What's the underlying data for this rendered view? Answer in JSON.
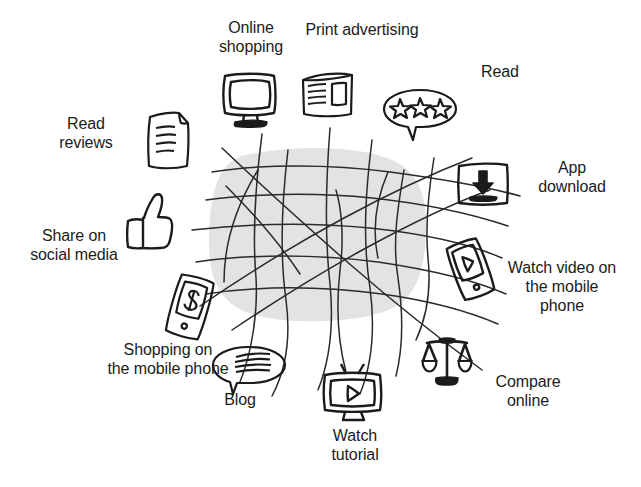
{
  "diagram": {
    "background_color": "#ffffff",
    "ink_color": "#1b1b1b",
    "blob_color": "#e3e3e3",
    "center": {
      "name": "connection-web",
      "description": "grey rounded blob overlaid with hand-drawn crossing lines"
    },
    "nodes": [
      {
        "id": "online-shopping",
        "label": "Online\nshopping",
        "icon": "desktop-monitor-icon",
        "label_x": 196,
        "label_y": 18,
        "label_w": 110,
        "label_align": "center",
        "icon_x": 219,
        "icon_y": 70,
        "icon_w": 62,
        "icon_h": 58
      },
      {
        "id": "print-advertising",
        "label": "Print advertising",
        "icon": "newspaper-icon",
        "label_x": 292,
        "label_y": 20,
        "label_w": 140,
        "label_align": "center",
        "icon_x": 299,
        "icon_y": 70,
        "icon_w": 58,
        "icon_h": 52
      },
      {
        "id": "read",
        "label": "Read",
        "icon": "star-rating-bubble-icon",
        "label_x": 455,
        "label_y": 62,
        "label_w": 90,
        "label_align": "center",
        "icon_x": 380,
        "icon_y": 86,
        "icon_w": 80,
        "icon_h": 60
      },
      {
        "id": "app-download",
        "label": "App\ndownload",
        "icon": "download-box-icon",
        "label_x": 520,
        "label_y": 158,
        "label_w": 104,
        "label_align": "center",
        "icon_x": 455,
        "icon_y": 160,
        "icon_w": 56,
        "icon_h": 48
      },
      {
        "id": "read-reviews",
        "label": "Read\nreviews",
        "icon": "document-lines-icon",
        "label_x": 38,
        "label_y": 114,
        "label_w": 96,
        "label_align": "center",
        "icon_x": 145,
        "icon_y": 110,
        "icon_w": 48,
        "icon_h": 62
      },
      {
        "id": "share-on-social-media",
        "label": "Share on\nsocial media",
        "icon": "thumbs-up-icon",
        "label_x": 18,
        "label_y": 226,
        "label_w": 112,
        "label_align": "center",
        "icon_x": 122,
        "icon_y": 190,
        "icon_w": 54,
        "icon_h": 62
      },
      {
        "id": "shopping-on-the-mobile-phone",
        "label": "Shopping on\nthe mobile phone",
        "icon": "mobile-dollar-icon",
        "label_x": 100,
        "label_y": 340,
        "label_w": 136,
        "label_align": "center",
        "icon_x": 165,
        "icon_y": 274,
        "icon_w": 50,
        "icon_h": 68
      },
      {
        "id": "blog",
        "label": "Blog",
        "icon": "speech-bubble-lines-icon",
        "label_x": 200,
        "label_y": 390,
        "label_w": 80,
        "label_align": "center",
        "icon_x": 210,
        "icon_y": 344,
        "icon_w": 78,
        "icon_h": 52
      },
      {
        "id": "watch-tutorial",
        "label": "Watch\ntutorial",
        "icon": "tv-play-icon",
        "label_x": 315,
        "label_y": 426,
        "label_w": 80,
        "label_align": "center",
        "icon_x": 320,
        "icon_y": 362,
        "icon_w": 66,
        "icon_h": 62
      },
      {
        "id": "compare-online",
        "label": "Compare\nonline",
        "icon": "balance-scales-icon",
        "label_x": 478,
        "label_y": 372,
        "label_w": 100,
        "label_align": "center",
        "icon_x": 420,
        "icon_y": 334,
        "icon_w": 54,
        "icon_h": 56
      },
      {
        "id": "watch-video-on-the-mobile-phone",
        "label": "Watch video on\nthe mobile\nphone",
        "icon": "mobile-video-icon",
        "label_x": 498,
        "label_y": 258,
        "label_w": 128,
        "label_align": "center",
        "icon_x": 447,
        "icon_y": 238,
        "icon_w": 48,
        "icon_h": 62
      }
    ]
  }
}
